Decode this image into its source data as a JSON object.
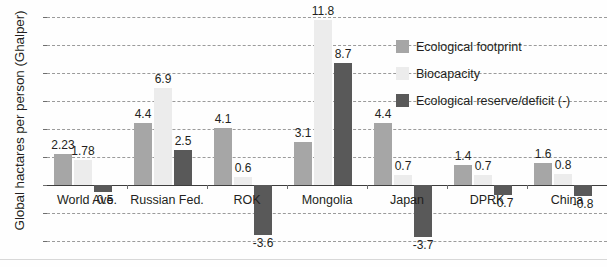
{
  "chart_data": {
    "type": "bar",
    "title": "",
    "subtitle": "",
    "xlabel": "",
    "ylabel": "Global hactares per person (Ghalper)",
    "ylim": [
      -4,
      12
    ],
    "yticks": [
      12,
      10,
      8,
      6,
      4,
      2,
      0,
      -2,
      -4
    ],
    "ytick_labels": [
      "12",
      "10",
      "8",
      "6",
      "4",
      "2",
      "0",
      "-2",
      "-4"
    ],
    "grid": true,
    "legend_position": "top-right",
    "categories": [
      "World Ave.",
      "Russian Fed.",
      "ROK",
      "Mongolia",
      "Japan",
      "DPRK",
      "China"
    ],
    "series": [
      {
        "name": "Ecological footprint",
        "color": "#a6a6a6",
        "values": [
          2.23,
          4.4,
          4.1,
          3.1,
          4.4,
          1.4,
          1.6
        ],
        "labels": [
          "2.23",
          "4.4",
          "4.1",
          "3.1",
          "4.4",
          "1.4",
          "1.6"
        ]
      },
      {
        "name": "Biocapacity",
        "color": "#ececec",
        "values": [
          1.78,
          6.9,
          0.6,
          11.8,
          0.7,
          0.7,
          0.8
        ],
        "labels": [
          "1.78",
          "6.9",
          "0.6",
          "11.8",
          "0.7",
          "0.7",
          "0.8"
        ]
      },
      {
        "name": "Ecological reserve/deficit (-)",
        "color": "#595959",
        "values": [
          -0.5,
          2.5,
          -3.6,
          8.7,
          -3.7,
          -0.7,
          -0.8
        ],
        "labels": [
          "-0.5",
          "2.5",
          "-3.6",
          "8.7",
          "-3.7",
          "-0.7",
          "-0.8"
        ]
      }
    ]
  },
  "legend": {
    "items": [
      {
        "label": "Ecological footprint",
        "swatch": "footprint"
      },
      {
        "label": "Biocapacity",
        "swatch": "biocap"
      },
      {
        "label": "Ecological reserve/deficit (-)",
        "swatch": "reserve"
      }
    ]
  },
  "axis": {
    "y_title": "Global hactares per person (Ghalper)"
  }
}
